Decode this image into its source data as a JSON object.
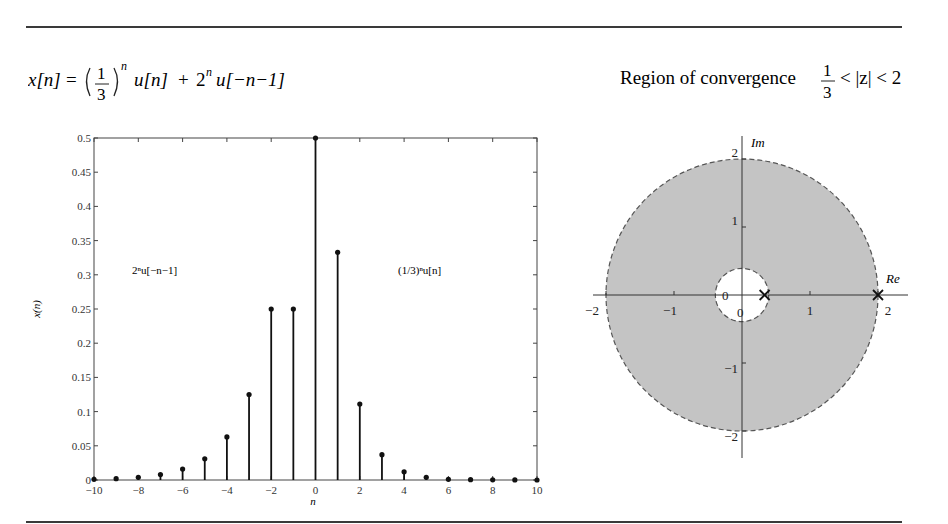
{
  "header": {
    "signal_formula": {
      "lhs": "x[n]",
      "eq": "=",
      "frac_num": "1",
      "frac_den": "3",
      "exp": "n",
      "term1_tail": "u[n]",
      "plus": "+",
      "term2_base": "2",
      "term2_exp": "n",
      "term2_tail": "u[−n−1]"
    },
    "roc": {
      "label": "Region of convergence",
      "frac_num": "1",
      "frac_den": "3",
      "inequality": "< |z| < 2"
    }
  },
  "chart_data": [
    {
      "type": "stem",
      "title": "",
      "xlabel": "n",
      "ylabel": "x(n)",
      "xlim": [
        -10,
        10
      ],
      "ylim": [
        0,
        0.5
      ],
      "x_ticks": [
        "−10",
        "−8",
        "−6",
        "−4",
        "−2",
        "0",
        "2",
        "4",
        "6",
        "8",
        "10"
      ],
      "y_ticks": [
        "0",
        "0.05",
        "0.1",
        "0.15",
        "0.2",
        "0.25",
        "0.3",
        "0.35",
        "0.4",
        "0.45",
        "0.5"
      ],
      "x": [
        -10,
        -9,
        -8,
        -7,
        -6,
        -5,
        -4,
        -3,
        -2,
        -1,
        0,
        1,
        2,
        3,
        4,
        5,
        6,
        7,
        8,
        9,
        10
      ],
      "values": [
        0.001,
        0.002,
        0.004,
        0.008,
        0.016,
        0.031,
        0.063,
        0.125,
        0.25,
        0.25,
        0.5,
        0.333,
        0.111,
        0.037,
        0.012,
        0.004,
        0.001,
        0.0005,
        0.0002,
        0.0001,
        0.0
      ],
      "annotations": [
        {
          "text": "2ⁿu[−n−1]",
          "x": -7.5,
          "y": 0.3
        },
        {
          "text": "(1/3)ⁿu[n]",
          "x": 3.8,
          "y": 0.3
        }
      ],
      "grid": false
    },
    {
      "type": "pole-zero",
      "xlabel": "Re",
      "ylabel": "Im",
      "xlim": [
        -2,
        2
      ],
      "ylim": [
        -2,
        2
      ],
      "x_ticks": [
        "−2",
        "−1",
        "0",
        "1",
        "2"
      ],
      "y_ticks": [
        "−2",
        "−1",
        "0",
        "1",
        "2"
      ],
      "roc_inner_radius": 0.333,
      "roc_outer_radius": 2,
      "roc_fill": "#c4c4c4",
      "poles": [
        [
          0.333,
          0
        ],
        [
          2,
          0
        ]
      ],
      "zeros": [
        [
          0,
          0
        ]
      ],
      "zero_labels": [
        "0",
        "0"
      ]
    }
  ]
}
